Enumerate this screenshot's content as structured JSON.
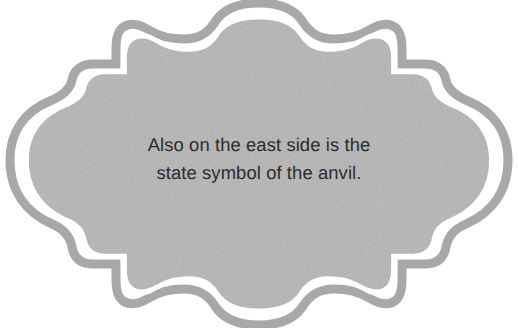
{
  "canvas": {
    "width": 518,
    "height": 328,
    "background_color": "#ffffff"
  },
  "plaque": {
    "name": "decorative-ornate-label",
    "shape": "scalloped-bracket-plaque",
    "fill_color": "#bfbfbf",
    "fill_texture": "fine-grain-noise",
    "outline_color": "#a8a8a8",
    "outline_width_px": 9,
    "inner_gap_color": "#ffffff",
    "inner_gap_width_px": 5
  },
  "caption": {
    "line1": "Also on the east side is the",
    "line2": "state symbol of the anvil.",
    "full_text": "Also on the east side is the state symbol of the anvil.",
    "text_color": "#2c2c2c",
    "alignment": "center"
  }
}
